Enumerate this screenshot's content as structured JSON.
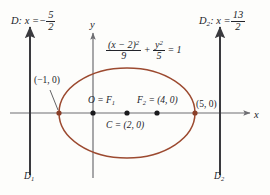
{
  "figure": {
    "type": "conic-section-diagram",
    "shape": "ellipse",
    "equation": {
      "numerator_x": "(x − 2)",
      "x_exponent": "2",
      "denominator_x": "9",
      "numerator_y": "y",
      "y_exponent": "2",
      "denominator_y": "5",
      "plus": "+",
      "equals": "= 1"
    },
    "axes": {
      "x_label": "x",
      "y_label": "y"
    },
    "directrices": [
      {
        "id": "D",
        "label": "D",
        "colon": ":",
        "var": "x =",
        "sign": "−",
        "num": "5",
        "den": "2",
        "bottom_label": "D",
        "bottom_sub": "1"
      },
      {
        "id": "D2",
        "label": "D",
        "sub": "2",
        "colon": ":",
        "var": "x =",
        "sign": "",
        "num": "13",
        "den": "2",
        "bottom_label": "D",
        "bottom_sub": "2"
      }
    ],
    "points": [
      {
        "name": "vertex-left",
        "label": "(−1, 0)",
        "x": -1,
        "y": 0
      },
      {
        "name": "origin-focus",
        "label": "O = F",
        "sub": "1",
        "x": 0,
        "y": 0
      },
      {
        "name": "center",
        "label": "C = (2, 0)",
        "x": 2,
        "y": 0
      },
      {
        "name": "focus-two",
        "label": "F",
        "sub": "2",
        "tail": " = (4, 0)",
        "x": 4,
        "y": 0
      },
      {
        "name": "vertex-right",
        "label": "(5, 0)",
        "x": 5,
        "y": 0
      }
    ],
    "colors": {
      "curve": "#9c4a30",
      "axis": "#6e6e72",
      "directrix": "#3a3a3e",
      "point": "#1a1a1c",
      "text": "#22242a",
      "background": "#fdfdfb"
    }
  }
}
